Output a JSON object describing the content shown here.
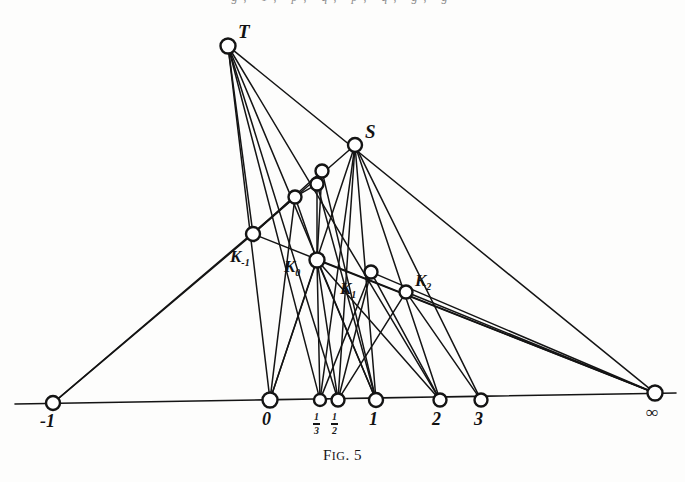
{
  "figure": {
    "caption_prefix": "F",
    "caption_small": "IG",
    "caption_suffix": ". 5",
    "caption_full": "FIG. 5",
    "partial_header_text": "g,  1,   p,  q,  p, q, g, g",
    "background_color": "#fdfdfc",
    "ink_color": "#141414",
    "node_fill": "#ffffff",
    "node_stroke": "#141414"
  },
  "nodes": [
    {
      "id": "T",
      "label": "T",
      "label_kind": "point",
      "x": 228,
      "y": 46,
      "r": 7.5,
      "lx": 238,
      "ly": 22
    },
    {
      "id": "S",
      "label": "S",
      "label_kind": "point",
      "x": 355,
      "y": 145,
      "r": 7.0,
      "lx": 365,
      "ly": 122
    },
    {
      "id": "Km1",
      "label": "K",
      "sub": "-1",
      "label_kind": "k",
      "x": 253,
      "y": 234,
      "r": 7.0,
      "lx": 230,
      "ly": 248
    },
    {
      "id": "K0",
      "label": "K",
      "sub": "0",
      "label_kind": "k",
      "x": 317,
      "y": 260,
      "r": 7.5,
      "lx": 284,
      "ly": 258
    },
    {
      "id": "K1",
      "label": "K",
      "sub": "1",
      "label_kind": "k",
      "x": 371,
      "y": 272,
      "r": 6.5,
      "lx": 340,
      "ly": 280
    },
    {
      "id": "K2",
      "label": "K",
      "sub": "2",
      "label_kind": "k",
      "x": 406,
      "y": 292,
      "r": 6.5,
      "lx": 415,
      "ly": 272
    },
    {
      "id": "A",
      "label": "",
      "label_kind": "none",
      "x": 295,
      "y": 197,
      "r": 6.5,
      "lx": 0,
      "ly": 0
    },
    {
      "id": "B",
      "label": "",
      "label_kind": "none",
      "x": 317,
      "y": 184,
      "r": 6.5,
      "lx": 0,
      "ly": 0
    },
    {
      "id": "C",
      "label": "",
      "label_kind": "none",
      "x": 322,
      "y": 171,
      "r": 6.5,
      "lx": 0,
      "ly": 0
    },
    {
      "id": "Pm1",
      "label": "-1",
      "label_kind": "axis",
      "x": 53,
      "y": 403,
      "r": 7.0,
      "lx": 40,
      "ly": 412
    },
    {
      "id": "P0",
      "label": "0",
      "label_kind": "axis",
      "x": 270,
      "y": 400,
      "r": 7.5,
      "lx": 262,
      "ly": 410
    },
    {
      "id": "P13",
      "label": "1/3",
      "label_kind": "frac",
      "num": "1",
      "den": "3",
      "x": 320,
      "y": 400,
      "r": 6.0,
      "lx": 313,
      "ly": 412
    },
    {
      "id": "P12",
      "label": "1/2",
      "label_kind": "frac",
      "num": "1",
      "den": "2",
      "x": 338,
      "y": 400,
      "r": 6.5,
      "lx": 331,
      "ly": 412
    },
    {
      "id": "P1",
      "label": "1",
      "label_kind": "axis",
      "x": 376,
      "y": 400,
      "r": 7.0,
      "lx": 369,
      "ly": 410
    },
    {
      "id": "P2",
      "label": "2",
      "label_kind": "axis",
      "x": 440,
      "y": 400,
      "r": 6.5,
      "lx": 432,
      "ly": 410
    },
    {
      "id": "P3",
      "label": "3",
      "label_kind": "axis",
      "x": 481,
      "y": 400,
      "r": 6.5,
      "lx": 474,
      "ly": 410
    },
    {
      "id": "Pinf",
      "label": "∞",
      "label_kind": "inf",
      "x": 655,
      "y": 393,
      "r": 7.5,
      "lx": 646,
      "ly": 404
    }
  ],
  "baseline": {
    "x1": 15,
    "y1": 404,
    "x2": 676,
    "y2": 393
  },
  "edges": [
    {
      "from": "T",
      "to": "P0"
    },
    {
      "from": "T",
      "to": "P13"
    },
    {
      "from": "T",
      "to": "P12"
    },
    {
      "from": "T",
      "to": "P1"
    },
    {
      "from": "T",
      "to": "P2"
    },
    {
      "from": "T",
      "to": "Pinf"
    },
    {
      "from": "T",
      "to": "Km1"
    },
    {
      "from": "S",
      "to": "Km1"
    },
    {
      "from": "S",
      "to": "P0"
    },
    {
      "from": "S",
      "to": "P13"
    },
    {
      "from": "S",
      "to": "P12"
    },
    {
      "from": "S",
      "to": "P1"
    },
    {
      "from": "S",
      "to": "P2"
    },
    {
      "from": "S",
      "to": "P3"
    },
    {
      "from": "Pm1",
      "to": "Km1"
    },
    {
      "from": "Pm1",
      "to": "A"
    },
    {
      "from": "Km1",
      "to": "C"
    },
    {
      "from": "Km1",
      "to": "Pinf"
    },
    {
      "from": "K0",
      "to": "Pinf"
    },
    {
      "from": "K1",
      "to": "Pinf"
    },
    {
      "from": "K2",
      "to": "Pinf"
    },
    {
      "from": "A",
      "to": "K0"
    },
    {
      "from": "B",
      "to": "K0"
    },
    {
      "from": "C",
      "to": "K0"
    },
    {
      "from": "A",
      "to": "B"
    },
    {
      "from": "B",
      "to": "C"
    },
    {
      "from": "A",
      "to": "P0"
    },
    {
      "from": "K0",
      "to": "P0"
    },
    {
      "from": "K0",
      "to": "P13"
    },
    {
      "from": "K0",
      "to": "P12"
    },
    {
      "from": "K0",
      "to": "P1"
    },
    {
      "from": "K0",
      "to": "P2"
    },
    {
      "from": "K1",
      "to": "P13"
    },
    {
      "from": "K1",
      "to": "P12"
    },
    {
      "from": "K1",
      "to": "P2"
    },
    {
      "from": "K2",
      "to": "P12"
    },
    {
      "from": "K2",
      "to": "P3"
    },
    {
      "from": "B",
      "to": "P1"
    },
    {
      "from": "C",
      "to": "P1"
    }
  ]
}
